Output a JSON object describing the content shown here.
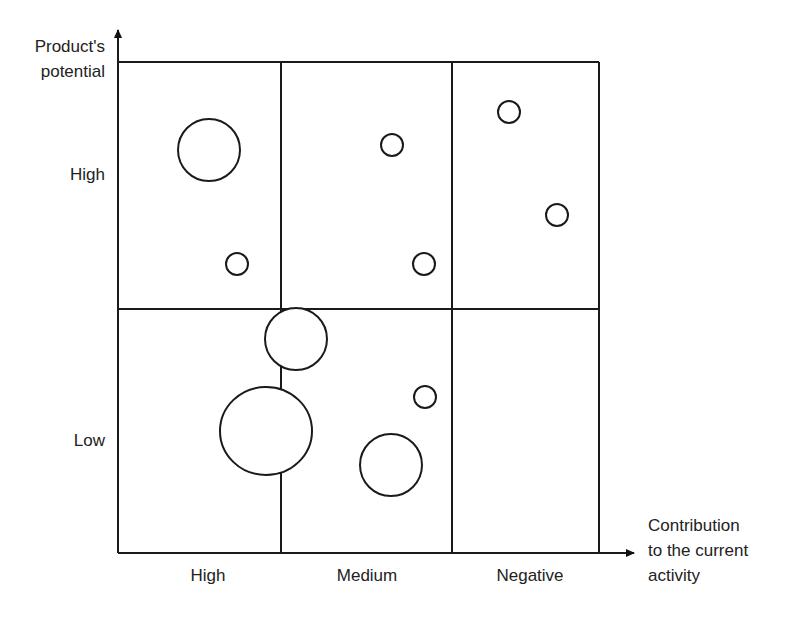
{
  "diagram": {
    "type": "bubble-matrix",
    "y_axis": {
      "label_line1": "Product's",
      "label_line2": "potential",
      "levels": [
        "High",
        "Low"
      ]
    },
    "x_axis": {
      "label_line1": "Contribution",
      "label_line2": "to the current",
      "label_line3": "activity",
      "levels": [
        "High",
        "Medium",
        "Negative"
      ]
    },
    "grid": {
      "rows": 2,
      "cols": 3
    },
    "bubbles": [
      {
        "cell": "High potential / High contribution",
        "cx": 209,
        "cy": 150,
        "r": 31
      },
      {
        "cell": "High potential / High contribution",
        "cx": 237,
        "cy": 264,
        "r": 11
      },
      {
        "cell": "High potential / Medium contribution",
        "cx": 392,
        "cy": 145,
        "r": 11
      },
      {
        "cell": "High potential / Medium contribution",
        "cx": 424,
        "cy": 264,
        "r": 11
      },
      {
        "cell": "High potential / Negative contribution",
        "cx": 509,
        "cy": 112,
        "r": 11
      },
      {
        "cell": "High potential / Negative contribution",
        "cx": 557,
        "cy": 215,
        "r": 11
      },
      {
        "cell": "Low potential / High-Medium boundary",
        "cx": 296,
        "cy": 339,
        "r": 31
      },
      {
        "cell": "Low potential / High-Medium boundary",
        "cx": 266,
        "cy": 431,
        "r": 45
      },
      {
        "cell": "Low potential / Medium contribution",
        "cx": 425,
        "cy": 397,
        "r": 11
      },
      {
        "cell": "Low potential / Medium contribution",
        "cx": 391,
        "cy": 465,
        "r": 31
      }
    ]
  }
}
